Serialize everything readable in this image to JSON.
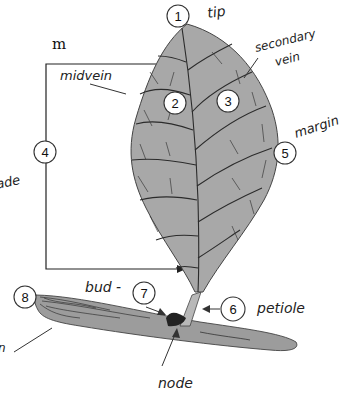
{
  "diagram": {
    "colors": {
      "leaf_fill": "#a8a8a8",
      "leaf_stroke": "#444444",
      "stem_fill": "#9c9c9c",
      "bud_fill": "#222222",
      "background": "#ffffff"
    },
    "partial_text": {
      "top_left": "m",
      "left_mid": "ade",
      "left_bottom": "n"
    },
    "labels": [
      {
        "number": "1",
        "text": "tip"
      },
      {
        "number": "2",
        "text": ""
      },
      {
        "number": "3",
        "text": ""
      },
      {
        "number": "4",
        "text": "blade"
      },
      {
        "number": "5",
        "text": "margin"
      },
      {
        "number": "6",
        "text": "petiole"
      },
      {
        "number": "7",
        "text": "bud"
      },
      {
        "number": "8",
        "text": ""
      }
    ],
    "annotations": {
      "midvein": "midvein",
      "secondary_vein_line1": "secondary",
      "secondary_vein_line2": "vein",
      "bud": "bud -",
      "node": "node"
    }
  }
}
